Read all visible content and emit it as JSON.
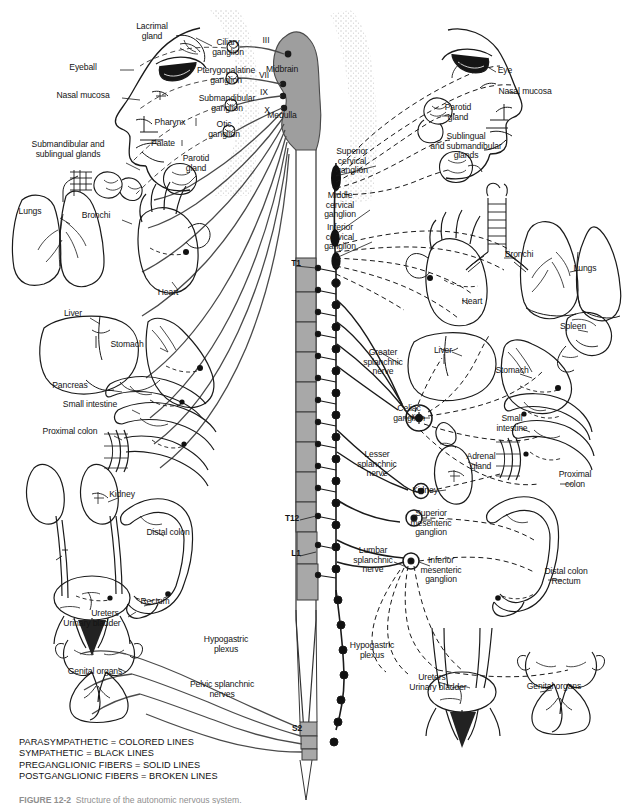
{
  "figure": {
    "caption_prefix": "FIGURE 12-2",
    "caption_text": "  Structure of the autonomic nervous system."
  },
  "legend": {
    "lines": [
      "PARASYMPATHETIC = COLORED LINES",
      "SYMPATHETIC = BLACK LINES",
      "PREGANGLIONIC FIBERS = SOLID LINES",
      "POSTGANGLIONIC FIBERS = BROKEN LINES"
    ]
  },
  "cns": {
    "brain_parts": [
      {
        "label": "Midbrain",
        "x": 282,
        "y": 70
      },
      {
        "label": "Medulla",
        "x": 282,
        "y": 116
      }
    ],
    "cranial_nerves": [
      {
        "label": "III",
        "x": 266,
        "y": 41
      },
      {
        "label": "VII",
        "x": 264,
        "y": 76
      },
      {
        "label": "IX",
        "x": 264,
        "y": 93
      },
      {
        "label": "X",
        "x": 267,
        "y": 111
      }
    ],
    "spinal_segments": [
      {
        "label": "T1",
        "x": 296,
        "y": 264
      },
      {
        "label": "T12",
        "x": 292,
        "y": 519
      },
      {
        "label": "L1",
        "x": 296,
        "y": 554
      },
      {
        "label": "S2",
        "x": 297,
        "y": 729
      }
    ]
  },
  "parasympathetic": {
    "side": "left",
    "ganglia": [
      {
        "label": "Ciliary\nganglion",
        "x": 228,
        "y": 48
      },
      {
        "label": "Pterygopalatine\nganglion",
        "x": 226,
        "y": 76
      },
      {
        "label": "Submandibular\nganglion",
        "x": 227,
        "y": 104
      },
      {
        "label": "Otic\nganglion",
        "x": 224,
        "y": 130
      }
    ],
    "targets_head": [
      {
        "label": "Lacrimal\ngland",
        "x": 152,
        "y": 32
      },
      {
        "label": "Eyeball",
        "x": 83,
        "y": 68
      },
      {
        "label": "Nasal mucosa",
        "x": 83,
        "y": 96
      },
      {
        "label": "Pharynx",
        "x": 170,
        "y": 123
      },
      {
        "label": "Palate",
        "x": 163,
        "y": 144
      },
      {
        "label": "Submandibular and\nsublingual glands",
        "x": 68,
        "y": 150
      },
      {
        "label": "Parotid\ngland",
        "x": 196,
        "y": 164
      }
    ],
    "targets_body": [
      {
        "label": "Lungs",
        "x": 30,
        "y": 212
      },
      {
        "label": "Bronchi",
        "x": 96,
        "y": 216
      },
      {
        "label": "Heart",
        "x": 168,
        "y": 293
      },
      {
        "label": "Liver",
        "x": 73,
        "y": 314
      },
      {
        "label": "Stomach",
        "x": 127,
        "y": 345
      },
      {
        "label": "Pancreas",
        "x": 70,
        "y": 386
      },
      {
        "label": "Small intestine",
        "x": 90,
        "y": 405
      },
      {
        "label": "Proximal colon",
        "x": 70,
        "y": 432
      },
      {
        "label": "Kidney",
        "x": 122,
        "y": 495
      },
      {
        "label": "Distal colon",
        "x": 168,
        "y": 533
      },
      {
        "label": "Rectum",
        "x": 155,
        "y": 602
      },
      {
        "label": "Ureters",
        "x": 105,
        "y": 614
      },
      {
        "label": "Urinary bladder",
        "x": 92,
        "y": 624
      },
      {
        "label": "Genital organs",
        "x": 95,
        "y": 672
      }
    ],
    "nerves": [
      {
        "label": "Hypogastric\nplexus",
        "x": 226,
        "y": 645
      },
      {
        "label": "Pelvic splanchnic\nnerves",
        "x": 222,
        "y": 690
      }
    ]
  },
  "sympathetic": {
    "side": "right",
    "chain_ganglia": [
      {
        "label": "Superior\ncervical\nganglion",
        "x": 352,
        "y": 161
      },
      {
        "label": "Middle\ncervical\nganglion",
        "x": 340,
        "y": 205
      },
      {
        "label": "Inferior\ncervical\nganglion",
        "x": 340,
        "y": 237
      }
    ],
    "prevertebral_ganglia": [
      {
        "label": "Celiac\nganglion",
        "x": 409,
        "y": 414
      },
      {
        "label": "Superior\nmesenteric\nganglion",
        "x": 431,
        "y": 523
      },
      {
        "label": "Inferior\nmesenteric\nganglion",
        "x": 441,
        "y": 570
      }
    ],
    "splanchnic_nerves": [
      {
        "label": "Greater\nsplanchnic\nnerve",
        "x": 383,
        "y": 362
      },
      {
        "label": "Lesser\nsplanchnic\nnerve",
        "x": 377,
        "y": 464
      },
      {
        "label": "Lumbar\nsplanchnic\nnerve",
        "x": 373,
        "y": 560
      },
      {
        "label": "Hypogastric\nplexus",
        "x": 372,
        "y": 651
      }
    ],
    "targets_head": [
      {
        "label": "Eye",
        "x": 505,
        "y": 71
      },
      {
        "label": "Nasal mucosa",
        "x": 525,
        "y": 92
      },
      {
        "label": "Parotid\ngland",
        "x": 458,
        "y": 113
      },
      {
        "label": "Sublingual\nand submandibular\nglands",
        "x": 466,
        "y": 146
      }
    ],
    "targets_body": [
      {
        "label": "Bronchi",
        "x": 519,
        "y": 255
      },
      {
        "label": "Lungs",
        "x": 585,
        "y": 269
      },
      {
        "label": "Heart",
        "x": 472,
        "y": 302
      },
      {
        "label": "Spleen",
        "x": 573,
        "y": 327
      },
      {
        "label": "Liver",
        "x": 443,
        "y": 351
      },
      {
        "label": "Stomach",
        "x": 512,
        "y": 371
      },
      {
        "label": "Small\nintestine",
        "x": 512,
        "y": 424
      },
      {
        "label": "Adrenal\ngland",
        "x": 481,
        "y": 462
      },
      {
        "label": "Kidney",
        "x": 425,
        "y": 491
      },
      {
        "label": "Proximal\ncolon",
        "x": 575,
        "y": 480
      },
      {
        "label": "Distal colon\nRectum",
        "x": 566,
        "y": 577
      },
      {
        "label": "Ureters",
        "x": 432,
        "y": 678
      },
      {
        "label": "Urinary bladder",
        "x": 438,
        "y": 688
      },
      {
        "label": "Genital organs",
        "x": 554,
        "y": 687
      }
    ]
  },
  "colors": {
    "ink": "#1a1a1a",
    "cord_fill": "#a8a8a8",
    "cord_stroke": "#333333",
    "brain_fill": "#9e9e9e",
    "stipple": "#b9b9b9",
    "para_line": "#4a4a4a",
    "background": "#ffffff"
  }
}
